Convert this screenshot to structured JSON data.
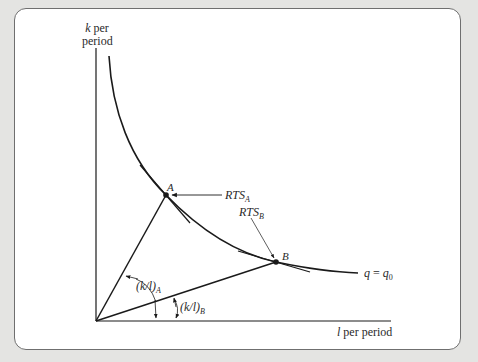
{
  "figure": {
    "y_axis_label_line1_var": "k",
    "y_axis_label_line1_rest": " per",
    "y_axis_label_line2": "period",
    "x_axis_label_var": "l",
    "x_axis_label_rest": " per period",
    "curve_label_lhs": "q",
    "curve_label_eq": " = ",
    "curve_label_rhs": "q",
    "curve_label_rhs_sub": "0",
    "point_a_label": "A",
    "point_b_label": "B",
    "rts_a_label": "RTS",
    "rts_a_sub": "A",
    "rts_b_label": "RTS",
    "rts_b_sub": "B",
    "ratio_a_label": "(k/l)",
    "ratio_a_sub": "A",
    "ratio_b_label": "(k/l)",
    "ratio_b_sub": "B"
  },
  "colors": {
    "background": "#e4e4e2",
    "card": "#ffffff",
    "card_border": "#6f6f6f",
    "line": "#1a1a1a",
    "text": "#2a2a2a"
  }
}
